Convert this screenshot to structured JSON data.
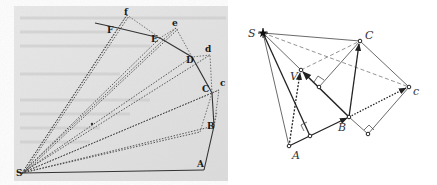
{
  "left_figure": {
    "description": "Newton's Principia figure: polygonal orbit around S with radius vectors",
    "background": "#e4e4e4",
    "labels": {
      "S": "S",
      "A": "A",
      "B": "B",
      "C": "C",
      "D": "D",
      "E": "E",
      "F": "F",
      "c": "c",
      "d": "d",
      "e": "e",
      "f": "f"
    }
  },
  "right_figure": {
    "description": "Modern vector diagram of equal-area argument with sun S",
    "labels": {
      "S": "S",
      "A": "A",
      "B": "B",
      "C": "C",
      "V": "V",
      "c": "c"
    },
    "sun_symbol": "star-icon"
  }
}
